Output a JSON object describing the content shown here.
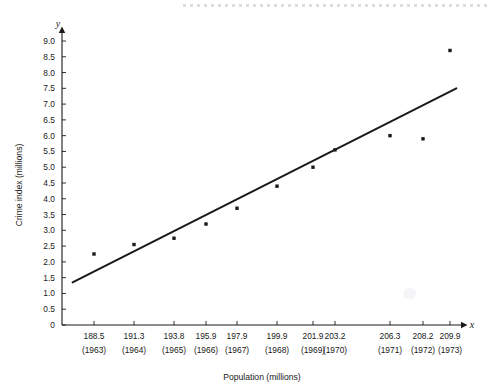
{
  "figure": {
    "axis_x_name": "x",
    "axis_y_name": "y",
    "has_top_perforation": true
  },
  "chart_data": {
    "type": "scatter",
    "title": "",
    "xlabel": "Population (millions)",
    "ylabel": "Crime index (millions)",
    "xlim": [
      186.8,
      211.5
    ],
    "ylim": [
      0,
      9.3
    ],
    "grid": false,
    "legend": "none",
    "x_tick_labels": [
      "188.5",
      "191.3",
      "193.8",
      "195.9",
      "197.9",
      "199.9",
      "201.9",
      "203.2",
      "206.3",
      "208.2",
      "209.9"
    ],
    "x_tick_sublabels": [
      "(1963)",
      "(1964)",
      "(1965)",
      "(1966)",
      "(1967)",
      "(1968)",
      "(1969)",
      "(1970)",
      "(1971)",
      "(1972)",
      "(1973)"
    ],
    "y_tick_labels": [
      "0",
      "0.5",
      "1.0",
      "1.5",
      "2.0",
      "2.5",
      "3.0",
      "3.5",
      "4.0",
      "4.5",
      "5.0",
      "5.5",
      "6.0",
      "6.5",
      "7.0",
      "7.5",
      "8.0",
      "8.5",
      "9.0"
    ],
    "y_tick_values": [
      0,
      0.5,
      1.0,
      1.5,
      2.0,
      2.5,
      3.0,
      3.5,
      4.0,
      4.5,
      5.0,
      5.5,
      6.0,
      6.5,
      7.0,
      7.5,
      8.0,
      8.5,
      9.0
    ],
    "x": [
      188.5,
      191.3,
      193.8,
      195.9,
      197.9,
      199.9,
      201.9,
      203.2,
      206.3,
      208.2,
      209.9
    ],
    "y": [
      2.25,
      2.55,
      2.75,
      3.2,
      3.7,
      4.4,
      5.0,
      5.55,
      6.0,
      5.9,
      8.7
    ],
    "years": [
      1963,
      1964,
      1965,
      1966,
      1967,
      1968,
      1969,
      1970,
      1971,
      1972,
      1973
    ],
    "trendline": {
      "type": "line",
      "x": [
        187.0,
        210.3
      ],
      "y": [
        1.35,
        7.5
      ]
    }
  }
}
